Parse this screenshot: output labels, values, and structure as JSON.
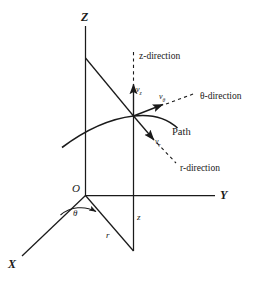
{
  "figure": {
    "background_color": "#ffffff",
    "line_color": "#1a1a1a",
    "axes": {
      "z_label": "Z",
      "y_label": "Y",
      "x_label": "X",
      "origin_label": "O"
    },
    "directions": {
      "z_direction": "z-direction",
      "theta_direction": "θ-direction",
      "r_direction": "r-direction"
    },
    "velocities": {
      "v_z_symbol": "v",
      "v_z_sub": "z",
      "v_theta_symbol": "v",
      "v_theta_sub": "θ",
      "v_r_symbol": "v",
      "v_r_sub": "r"
    },
    "coordinates": {
      "radius_label": "r",
      "height_label": "z",
      "angle_label": "θ"
    },
    "path_label": "Path"
  }
}
